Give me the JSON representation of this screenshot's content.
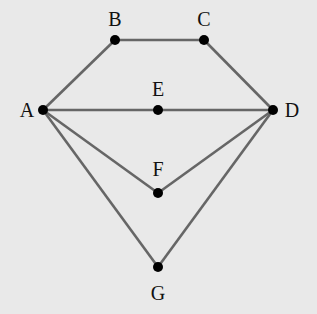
{
  "diagram": {
    "type": "graph",
    "background": "#e9e9e9",
    "edge_color": "#666666",
    "node_color": "#000000",
    "nodes": [
      {
        "id": "A",
        "label": "A",
        "x": 43,
        "y": 110,
        "lx": 27,
        "ly": 117
      },
      {
        "id": "B",
        "label": "B",
        "x": 115,
        "y": 40,
        "lx": 115,
        "ly": 26
      },
      {
        "id": "C",
        "label": "C",
        "x": 204,
        "y": 40,
        "lx": 204,
        "ly": 26
      },
      {
        "id": "D",
        "label": "D",
        "x": 273,
        "y": 110,
        "lx": 292,
        "ly": 117
      },
      {
        "id": "E",
        "label": "E",
        "x": 158,
        "y": 110,
        "lx": 158,
        "ly": 96
      },
      {
        "id": "F",
        "label": "F",
        "x": 158,
        "y": 193,
        "lx": 158,
        "ly": 176
      },
      {
        "id": "G",
        "label": "G",
        "x": 158,
        "y": 267,
        "lx": 158,
        "ly": 300
      }
    ],
    "edges": [
      [
        "A",
        "B"
      ],
      [
        "B",
        "C"
      ],
      [
        "C",
        "D"
      ],
      [
        "A",
        "E"
      ],
      [
        "E",
        "D"
      ],
      [
        "A",
        "F"
      ],
      [
        "F",
        "D"
      ],
      [
        "A",
        "G"
      ],
      [
        "G",
        "D"
      ]
    ]
  }
}
